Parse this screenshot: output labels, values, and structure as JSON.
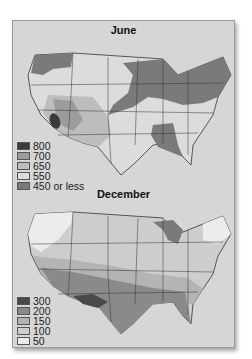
{
  "maps": [
    {
      "title": "June",
      "legend": [
        {
          "label": "800",
          "color": "#3a3a3a"
        },
        {
          "label": "700",
          "color": "#9c9c9c"
        },
        {
          "label": "650",
          "color": "#bdbdbd"
        },
        {
          "label": "550",
          "color": "#dcdcdc"
        },
        {
          "label": "450 or less",
          "color": "#7a7a7a"
        }
      ]
    },
    {
      "title": "December",
      "legend": [
        {
          "label": "300",
          "color": "#4a4a4a"
        },
        {
          "label": "200",
          "color": "#8a8a8a"
        },
        {
          "label": "150",
          "color": "#b4b4b4"
        },
        {
          "label": "100",
          "color": "#cdcdcd"
        },
        {
          "label": "50",
          "color": "#ececec"
        }
      ]
    }
  ],
  "colors": {
    "frame_bg": "#d6d6d6",
    "frame_border": "#9a9a9a",
    "state_lines": "#333333"
  }
}
